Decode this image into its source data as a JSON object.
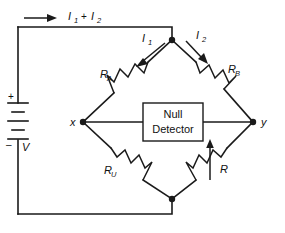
{
  "diagram": {
    "background_color": "#ffffff",
    "line_color": "#1a1a1a"
  },
  "labels": {
    "supply_current": {
      "symbol": "I",
      "sub1": "1",
      "plus": "+",
      "symbol2": "I",
      "sub2": "2"
    },
    "branch_current_left": {
      "symbol": "I",
      "sub": "1"
    },
    "branch_current_right": {
      "symbol": "I",
      "sub": "2"
    },
    "resistor_a": {
      "symbol": "R",
      "sub": "A"
    },
    "resistor_b": {
      "symbol": "R",
      "sub": "B"
    },
    "resistor_u": {
      "symbol": "R",
      "sub": "U"
    },
    "resistor_variable": {
      "symbol": "R",
      "sub": ""
    },
    "node_x": "x",
    "node_y": "y",
    "battery_plus": "+",
    "battery_minus": "–",
    "battery_voltage": "V"
  },
  "detector": {
    "line1": "Null",
    "line2": "Detector"
  },
  "components": [
    {
      "name": "resistor-a",
      "type": "resistor",
      "label": "R_A"
    },
    {
      "name": "resistor-b",
      "type": "resistor",
      "label": "R_B"
    },
    {
      "name": "resistor-u",
      "type": "resistor",
      "label": "R_U"
    },
    {
      "name": "resistor-variable",
      "type": "variable-resistor",
      "label": "R"
    },
    {
      "name": "battery",
      "type": "dc-source",
      "label": "V"
    },
    {
      "name": "null-detector",
      "type": "instrument-box",
      "label": "Null Detector"
    }
  ]
}
